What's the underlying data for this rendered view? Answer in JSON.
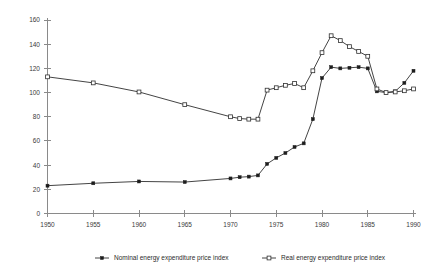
{
  "chart_data": {
    "type": "line",
    "title": "",
    "subtitle": "",
    "xlabel": "",
    "ylabel": "",
    "xlim": [
      1950,
      1990
    ],
    "ylim": [
      0,
      160
    ],
    "grid": false,
    "legend_position": "bottom",
    "x_ticks": [
      "1950",
      "1955",
      "1960",
      "1965",
      "1970",
      "1975",
      "1980",
      "1985",
      "1990"
    ],
    "y_ticks": [
      "0",
      "20",
      "40",
      "60",
      "80",
      "100",
      "120",
      "140",
      "160"
    ],
    "x": [
      1950,
      1955,
      1960,
      1965,
      1970,
      1971,
      1972,
      1973,
      1974,
      1975,
      1976,
      1977,
      1978,
      1979,
      1980,
      1981,
      1982,
      1983,
      1984,
      1985,
      1986,
      1987,
      1988,
      1989,
      1990
    ],
    "series": [
      {
        "name": "Nominal energy expenditure price index",
        "marker": "filled-square",
        "values": [
          23,
          25,
          26.5,
          26,
          29,
          30,
          30.5,
          31.5,
          41,
          46,
          50,
          55,
          58,
          78,
          112,
          121,
          120,
          120.5,
          121,
          120,
          101,
          100,
          101,
          108,
          118
        ]
      },
      {
        "name": "Real energy expenditure price index",
        "marker": "open-square",
        "values": [
          113,
          108,
          100.5,
          90,
          80,
          78.5,
          78,
          78,
          102,
          104,
          106,
          107.5,
          104,
          118,
          133,
          147,
          143,
          138,
          134,
          130,
          103,
          100,
          100.5,
          101.5,
          103
        ]
      }
    ]
  },
  "legend": {
    "entries": [
      {
        "label": "Nominal energy expenditure price index",
        "marker": "filled-square"
      },
      {
        "label": "Real energy expenditure price index",
        "marker": "open-square"
      }
    ]
  }
}
